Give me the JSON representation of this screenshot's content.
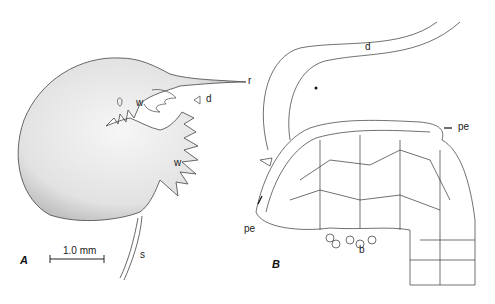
{
  "figure": {
    "panel_a": {
      "letter": "A",
      "labels": {
        "r": "r",
        "d": "d",
        "w1": "w",
        "w2": "w",
        "s": "s"
      },
      "scale_bar": "1.0 mm"
    },
    "panel_b": {
      "letter": "B",
      "labels": {
        "d": "d",
        "pe_right": "pe",
        "pe_left": "pe",
        "b": "b"
      }
    }
  }
}
